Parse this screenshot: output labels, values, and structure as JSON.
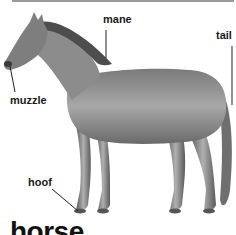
{
  "entry": {
    "word": "horse"
  },
  "labels": {
    "mane": "mane",
    "tail": "tail",
    "muzzle": "muzzle",
    "hoof": "hoof"
  },
  "illustration": {
    "subject": "horse",
    "colors": {
      "body": "#8a8a8a",
      "dark": "#4a4a4a",
      "light": "#c8c8c8"
    }
  }
}
